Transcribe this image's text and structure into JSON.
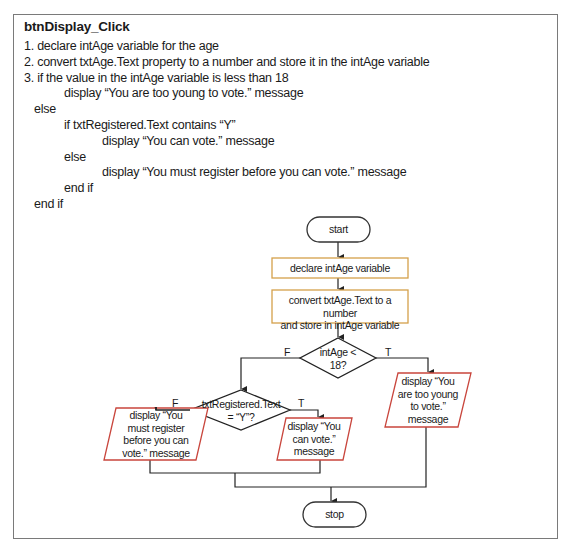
{
  "title": "btnDisplay_Click",
  "pseudocode": [
    {
      "indent": 0,
      "text": "1. declare intAge variable for the age"
    },
    {
      "indent": 0,
      "text": "2. convert txtAge.Text property to a number and store it in the intAge variable"
    },
    {
      "indent": 0,
      "text": "3. if the value in the intAge variable is less than 18"
    },
    {
      "indent": 3,
      "text": "display “You are too young to vote.” message"
    },
    {
      "indent": 1,
      "text": "else"
    },
    {
      "indent": 2,
      "text": "if txtRegistered.Text contains “Y”"
    },
    {
      "indent": 4,
      "text": "display “You can vote.” message"
    },
    {
      "indent": 2,
      "text": "else"
    },
    {
      "indent": 4,
      "text": "display “You must register before you can vote.” message"
    },
    {
      "indent": 2,
      "text": "end if"
    },
    {
      "indent": 1,
      "text": "end if"
    }
  ],
  "flowchart": {
    "colors": {
      "process_border": "#d4a04a",
      "io_border": "#c9463d",
      "terminal_border": "#333333",
      "line": "#222222",
      "frame": "#7a7a7a"
    },
    "start": "start",
    "declare": "declare intAge variable",
    "convert": [
      "convert txtAge.Text to a number",
      "and store in intAge variable"
    ],
    "decision_age": [
      "intAge <",
      "18?"
    ],
    "decision_registered": [
      "txtRegistered.Text",
      "= “Y”?"
    ],
    "output_too_young": [
      "display “You",
      "are too young",
      "to vote.”",
      "message"
    ],
    "output_can_vote": [
      "display “You",
      "can vote.”",
      "message"
    ],
    "output_must_register": [
      "display “You",
      "must register",
      "before you can",
      "vote.” message"
    ],
    "stop": "stop",
    "branch_labels": {
      "age_false": "F",
      "age_true": "T",
      "registered_false": "F",
      "registered_true": "T"
    }
  }
}
